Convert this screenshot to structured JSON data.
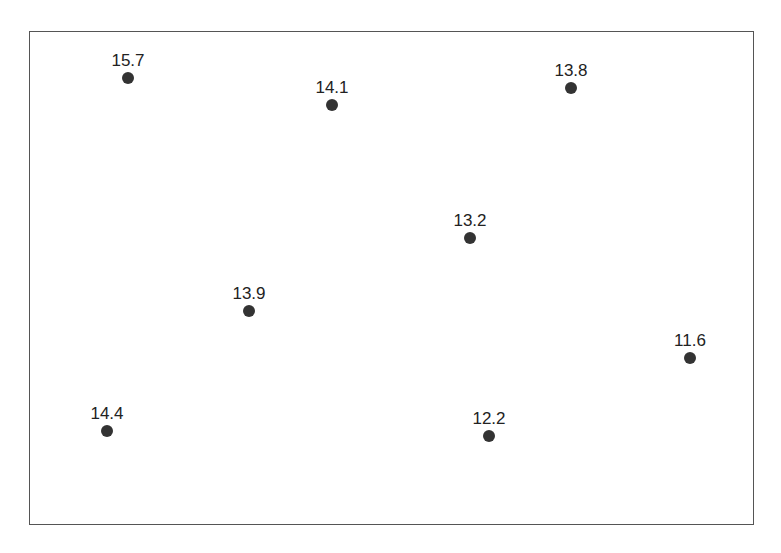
{
  "chart_data": {
    "type": "scatter",
    "title": "",
    "xlabel": "",
    "ylabel": "",
    "grid": false,
    "legend": null,
    "frame": {
      "left": 29,
      "top": 31,
      "right": 754,
      "bottom": 525
    },
    "points": [
      {
        "label": "15.7",
        "value": 15.7,
        "px": 128,
        "py": 78
      },
      {
        "label": "14.1",
        "value": 14.1,
        "px": 332,
        "py": 105
      },
      {
        "label": "13.8",
        "value": 13.8,
        "px": 571,
        "py": 88
      },
      {
        "label": "13.2",
        "value": 13.2,
        "px": 470,
        "py": 238
      },
      {
        "label": "13.9",
        "value": 13.9,
        "px": 249,
        "py": 311
      },
      {
        "label": "11.6",
        "value": 11.6,
        "px": 690,
        "py": 358
      },
      {
        "label": "14.4",
        "value": 14.4,
        "px": 107,
        "py": 431
      },
      {
        "label": "12.2",
        "value": 12.2,
        "px": 489,
        "py": 436
      }
    ],
    "colors": {
      "point": "#333333",
      "frame": "#555555",
      "text": "#222222"
    }
  }
}
